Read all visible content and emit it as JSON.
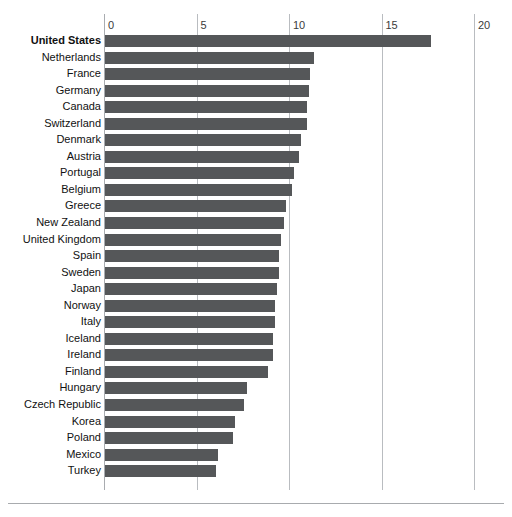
{
  "chart_data": {
    "type": "bar",
    "orientation": "horizontal",
    "title": "",
    "subtitle": "",
    "xlabel": "",
    "ylabel": "",
    "xlim": [
      0,
      20
    ],
    "ylim": null,
    "grid": true,
    "gridlines_axis": "x",
    "legend": false,
    "legend_position": "none",
    "tick_labels": [
      "0",
      "5",
      "10",
      "15",
      "20"
    ],
    "tick_values": [
      0,
      5,
      10,
      15,
      20
    ],
    "bar_color": "#555759",
    "highlight_category": "United States",
    "categories": [
      "United States",
      "Netherlands",
      "France",
      "Germany",
      "Canada",
      "Switzerland",
      "Denmark",
      "Austria",
      "Portugal",
      "Belgium",
      "Greece",
      "New Zealand",
      "United Kingdom",
      "Spain",
      "Sweden",
      "Japan",
      "Norway",
      "Italy",
      "Iceland",
      "Ireland",
      "Finland",
      "Hungary",
      "Czech Republic",
      "Korea",
      "Poland",
      "Mexico",
      "Turkey"
    ],
    "values": [
      17.6,
      11.3,
      11.1,
      11.0,
      10.9,
      10.9,
      10.6,
      10.5,
      10.2,
      10.1,
      9.8,
      9.7,
      9.5,
      9.4,
      9.4,
      9.3,
      9.2,
      9.2,
      9.1,
      9.1,
      8.8,
      7.7,
      7.5,
      7.0,
      6.9,
      6.1,
      6.0
    ]
  },
  "footer": {
    "note": ""
  }
}
